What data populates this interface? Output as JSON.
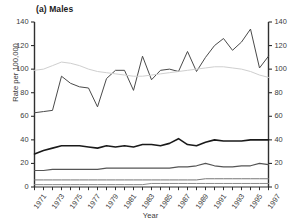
{
  "figure": {
    "panel_label": "(a) Males",
    "cropped_header_text": "",
    "background_color": "#ffffff"
  },
  "chart_data": {
    "type": "line",
    "title": "(a) Males",
    "xlabel": "Year",
    "ylabel": "Rate per 100,000",
    "ylim": [
      0,
      140
    ],
    "xlim": [
      1971,
      1997
    ],
    "ytick_values": [
      0,
      20,
      40,
      60,
      80,
      100,
      120,
      140
    ],
    "ytick_labels": [
      "0",
      "20",
      "40",
      "60",
      "80",
      "100",
      "120",
      "140"
    ],
    "right_axis": true,
    "right_ytick_labels": [
      "0",
      "20",
      "40",
      "60",
      "80",
      "100",
      "120",
      "140"
    ],
    "xtick_values": [
      1971,
      1973,
      1975,
      1977,
      1979,
      1981,
      1983,
      1985,
      1987,
      1989,
      1991,
      1993,
      1995,
      1997
    ],
    "xtick_labels": [
      "1971",
      "1973",
      "1975",
      "1977",
      "1979",
      "1981",
      "1983",
      "1985",
      "1987",
      "1989",
      "1991",
      "1993",
      "1995",
      "1997"
    ],
    "xtick_rotation": -55,
    "grid": false,
    "legend": "none",
    "x": [
      1971,
      1972,
      1973,
      1974,
      1975,
      1976,
      1977,
      1978,
      1979,
      1980,
      1981,
      1982,
      1983,
      1984,
      1985,
      1986,
      1987,
      1988,
      1989,
      1990,
      1991,
      1992,
      1993,
      1994,
      1995,
      1996,
      1997
    ],
    "series": [
      {
        "name": "series-1",
        "color": "#4a4a4a",
        "width": 1.0,
        "values": [
          63,
          64,
          65,
          94,
          88,
          85,
          84,
          68,
          92,
          99,
          99,
          82,
          111,
          91,
          99,
          100,
          98,
          115,
          98,
          110,
          120,
          126,
          116,
          123,
          134,
          101,
          111
        ]
      },
      {
        "name": "series-2",
        "color": "#cfcfcf",
        "width": 1.0,
        "values": [
          99,
          100,
          103,
          106,
          105,
          103,
          100,
          98,
          97,
          96,
          95,
          94,
          94,
          95,
          96,
          97,
          98,
          99,
          100,
          101,
          102,
          102,
          101,
          100,
          98,
          95,
          93
        ]
      },
      {
        "name": "series-3",
        "color": "#1a1a1a",
        "width": 1.6,
        "values": [
          28,
          31,
          33,
          35,
          35,
          35,
          34,
          33,
          35,
          34,
          35,
          34,
          36,
          36,
          35,
          37,
          41,
          36,
          35,
          38,
          40,
          39,
          39,
          39,
          40,
          40,
          40
        ]
      },
      {
        "name": "series-4",
        "color": "#555555",
        "width": 1.2,
        "values": [
          14,
          14,
          15,
          15,
          15,
          15,
          15,
          15,
          16,
          16,
          16,
          16,
          16,
          16,
          16,
          16,
          17,
          17,
          18,
          20,
          18,
          17,
          17,
          18,
          18,
          20,
          19
        ]
      },
      {
        "name": "series-5",
        "color": "#777777",
        "width": 1.0,
        "values": [
          6,
          6,
          6,
          6,
          6,
          6,
          6,
          6,
          6,
          6,
          6,
          6,
          6,
          6,
          6,
          6,
          6,
          6,
          6,
          7,
          7,
          7,
          7,
          7,
          7,
          7,
          7
        ]
      },
      {
        "name": "series-6",
        "color": "#8a8a8a",
        "width": 1.0,
        "values": [
          2,
          2,
          2,
          2,
          2,
          2,
          2,
          2,
          2,
          2,
          2,
          2,
          2,
          3,
          3,
          3,
          3,
          3,
          3,
          3,
          3,
          3,
          3,
          3,
          3,
          3,
          3
        ]
      }
    ]
  }
}
